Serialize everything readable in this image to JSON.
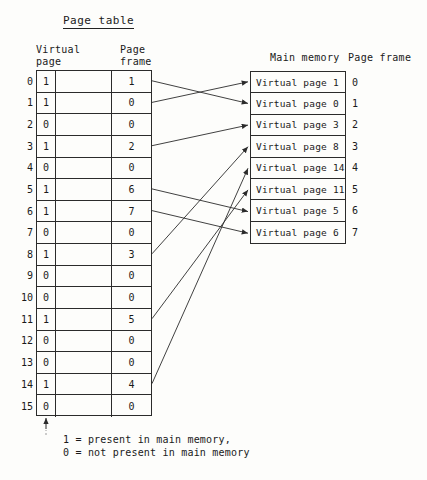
{
  "figure": {
    "title": "Page table",
    "headers": {
      "virtual_page": "Virtual\npage",
      "virtual_page_line1": "Virtual",
      "virtual_page_line2": "page",
      "page_frame_line1": "Page",
      "page_frame_line2": "frame",
      "main_memory": "Main memory",
      "memory_page_frame": "Page frame"
    },
    "legend": {
      "line1": "1 = present in main memory,",
      "line2": "0 = not present in main memory"
    },
    "colors": {
      "ink": "#2b2b2b",
      "paper": "#fdfdfb"
    }
  },
  "page_table": {
    "columns": [
      "virtual_page",
      "present_bit",
      "page_frame"
    ],
    "rows": [
      {
        "virtual_page": "0",
        "present": "1",
        "frame": "1"
      },
      {
        "virtual_page": "1",
        "present": "1",
        "frame": "0"
      },
      {
        "virtual_page": "2",
        "present": "0",
        "frame": "0"
      },
      {
        "virtual_page": "3",
        "present": "1",
        "frame": "2"
      },
      {
        "virtual_page": "4",
        "present": "0",
        "frame": "0"
      },
      {
        "virtual_page": "5",
        "present": "1",
        "frame": "6"
      },
      {
        "virtual_page": "6",
        "present": "1",
        "frame": "7"
      },
      {
        "virtual_page": "7",
        "present": "0",
        "frame": "0"
      },
      {
        "virtual_page": "8",
        "present": "1",
        "frame": "3"
      },
      {
        "virtual_page": "9",
        "present": "0",
        "frame": "0"
      },
      {
        "virtual_page": "10",
        "present": "0",
        "frame": "0"
      },
      {
        "virtual_page": "11",
        "present": "1",
        "frame": "5"
      },
      {
        "virtual_page": "12",
        "present": "0",
        "frame": "0"
      },
      {
        "virtual_page": "13",
        "present": "0",
        "frame": "0"
      },
      {
        "virtual_page": "14",
        "present": "1",
        "frame": "4"
      },
      {
        "virtual_page": "15",
        "present": "0",
        "frame": "0"
      }
    ]
  },
  "main_memory": {
    "rows": [
      {
        "content": "Virtual page 1",
        "frame": "0"
      },
      {
        "content": "Virtual page 0",
        "frame": "1"
      },
      {
        "content": "Virtual page 3",
        "frame": "2"
      },
      {
        "content": "Virtual page 8",
        "frame": "3"
      },
      {
        "content": "Virtual page 14",
        "frame": "4"
      },
      {
        "content": "Virtual page 11",
        "frame": "5"
      },
      {
        "content": "Virtual page 5",
        "frame": "6"
      },
      {
        "content": "Virtual page 6",
        "frame": "7"
      }
    ]
  },
  "mappings": [
    {
      "from_virtual_page": "0",
      "to_frame": "1"
    },
    {
      "from_virtual_page": "1",
      "to_frame": "0"
    },
    {
      "from_virtual_page": "3",
      "to_frame": "2"
    },
    {
      "from_virtual_page": "5",
      "to_frame": "6"
    },
    {
      "from_virtual_page": "6",
      "to_frame": "7"
    },
    {
      "from_virtual_page": "8",
      "to_frame": "3"
    },
    {
      "from_virtual_page": "11",
      "to_frame": "5"
    },
    {
      "from_virtual_page": "14",
      "to_frame": "4"
    }
  ]
}
